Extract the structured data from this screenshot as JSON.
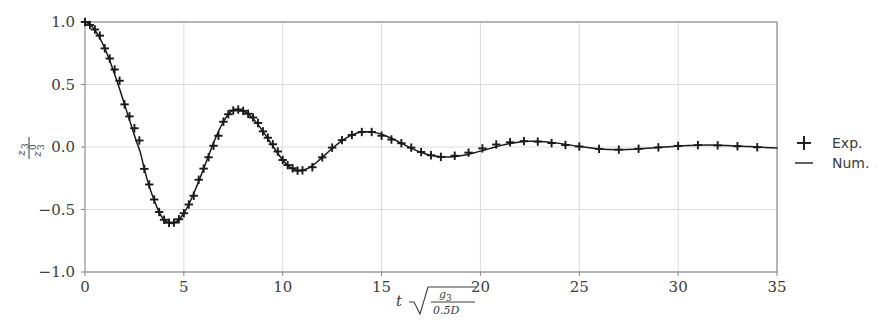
{
  "figure": {
    "background_color": "#ffffff",
    "axes_color": "#888888",
    "grid_color": "#d8d8d8",
    "data_color": "#1a1a1a",
    "text_color": "#3c3c3c"
  },
  "axes": {
    "x": {
      "label_plain": "t sqrt(g3 / (0.5 D))",
      "label_parts": {
        "variable": "t",
        "radical": "√",
        "numerator": "g",
        "numerator_sub": "3",
        "denominator": "0.5D"
      },
      "ticks": [
        "0",
        "5",
        "10",
        "15",
        "20",
        "25",
        "30",
        "35"
      ],
      "tick_values": [
        0,
        5,
        10,
        15,
        20,
        25,
        30,
        35
      ],
      "min": 0,
      "max": 35
    },
    "y": {
      "label_plain": "z3 / z3^0",
      "label_parts": {
        "numerator": "z",
        "numerator_sub": "3",
        "denominator": "z",
        "denominator_sub": "3",
        "denominator_sup": "0"
      },
      "ticks": [
        "1.0",
        "0.5",
        "0.0",
        "−0.5",
        "−1.0"
      ],
      "tick_values": [
        1.0,
        0.5,
        0.0,
        -0.5,
        -1.0
      ],
      "min": -1.0,
      "max": 1.0
    }
  },
  "legend": {
    "position": "right-outside",
    "entries": [
      {
        "label": "Exp.",
        "marker": "plus-marker",
        "style": "marker"
      },
      {
        "label": "Num.",
        "marker": "line-marker",
        "style": "line"
      }
    ]
  },
  "chart_data": {
    "type": "line",
    "title": "",
    "xlabel": "t √(g₃ / 0.5D)",
    "ylabel": "z₃ / z₃⁰",
    "xlim": [
      0,
      35
    ],
    "ylim": [
      -1.0,
      1.0
    ],
    "grid": true,
    "xticks": [
      0,
      5,
      10,
      15,
      20,
      25,
      30,
      35
    ],
    "yticks": [
      -1.0,
      -0.5,
      0.0,
      0.5,
      1.0
    ],
    "series": [
      {
        "name": "Num.",
        "style": "line",
        "x": [
          0.0,
          0.2,
          0.4,
          0.6,
          0.8,
          1.0,
          1.2,
          1.4,
          1.6,
          1.8,
          2.0,
          2.2,
          2.4,
          2.6,
          2.8,
          3.0,
          3.2,
          3.4,
          3.6,
          3.8,
          4.0,
          4.2,
          4.4,
          4.6,
          4.8,
          5.0,
          5.2,
          5.4,
          5.6,
          5.8,
          6.0,
          6.2,
          6.4,
          6.6,
          6.8,
          7.0,
          7.2,
          7.4,
          7.6,
          7.8,
          8.0,
          8.2,
          8.4,
          8.6,
          8.8,
          9.0,
          9.2,
          9.4,
          9.6,
          9.8,
          10.0,
          10.2,
          10.4,
          10.6,
          10.8,
          11.0,
          11.2,
          11.4,
          11.6,
          11.8,
          12.0,
          12.4,
          12.8,
          13.2,
          13.6,
          14.0,
          14.4,
          14.8,
          15.2,
          15.6,
          16.0,
          16.4,
          16.8,
          17.2,
          17.6,
          18.0,
          18.5,
          19.0,
          19.5,
          20.0,
          20.5,
          21.0,
          21.5,
          22.0,
          22.5,
          23.0,
          23.5,
          24.0,
          25.0,
          26.0,
          27.0,
          28.0,
          29.0,
          30.0,
          31.0,
          32.0,
          33.0,
          34.0,
          35.0
        ],
        "y": [
          1.0,
          0.985,
          0.955,
          0.912,
          0.856,
          0.789,
          0.712,
          0.627,
          0.536,
          0.44,
          0.341,
          0.241,
          0.142,
          0.046,
          -0.045,
          -0.175,
          -0.289,
          -0.383,
          -0.466,
          -0.537,
          -0.582,
          -0.604,
          -0.611,
          -0.6,
          -0.572,
          -0.53,
          -0.474,
          -0.408,
          -0.334,
          -0.255,
          -0.173,
          -0.09,
          -0.008,
          0.07,
          0.141,
          0.202,
          0.252,
          0.287,
          0.3,
          0.298,
          0.289,
          0.27,
          0.243,
          0.209,
          0.169,
          0.125,
          0.079,
          0.031,
          -0.016,
          -0.062,
          -0.104,
          -0.14,
          -0.167,
          -0.184,
          -0.19,
          -0.187,
          -0.176,
          -0.159,
          -0.137,
          -0.111,
          -0.083,
          -0.026,
          0.027,
          0.071,
          0.103,
          0.12,
          0.122,
          0.111,
          0.09,
          0.062,
          0.03,
          -0.002,
          -0.031,
          -0.054,
          -0.07,
          -0.078,
          -0.079,
          -0.07,
          -0.054,
          -0.033,
          -0.011,
          0.011,
          0.028,
          0.04,
          0.046,
          0.045,
          0.039,
          0.029,
          0.004,
          -0.015,
          -0.021,
          -0.016,
          -0.004,
          0.008,
          0.015,
          0.015,
          0.009,
          0.0,
          -0.008
        ]
      },
      {
        "name": "Exp.",
        "style": "markers",
        "marker": "+",
        "x": [
          0.0,
          0.25,
          0.5,
          0.75,
          1.0,
          1.25,
          1.5,
          1.75,
          2.0,
          2.25,
          2.5,
          2.75,
          3.0,
          3.25,
          3.5,
          3.75,
          4.0,
          4.25,
          4.5,
          4.75,
          5.0,
          5.25,
          5.5,
          5.75,
          6.0,
          6.25,
          6.5,
          6.75,
          7.0,
          7.25,
          7.5,
          7.75,
          8.0,
          8.25,
          8.5,
          8.75,
          9.0,
          9.25,
          9.5,
          9.75,
          10.0,
          10.25,
          10.5,
          10.75,
          11.0,
          11.5,
          12.0,
          12.5,
          13.0,
          13.5,
          14.0,
          14.5,
          15.0,
          15.5,
          16.0,
          16.5,
          17.0,
          17.5,
          18.0,
          18.7,
          19.4,
          20.1,
          20.8,
          21.5,
          22.2,
          22.9,
          23.6,
          24.3,
          25.0,
          26.0,
          27.0,
          28.0,
          29.0,
          30.0,
          31.0,
          32.0,
          33.0,
          34.0
        ],
        "y": [
          1.0,
          0.976,
          0.94,
          0.891,
          0.789,
          0.708,
          0.62,
          0.53,
          0.341,
          0.245,
          0.15,
          0.052,
          -0.175,
          -0.3,
          -0.42,
          -0.52,
          -0.582,
          -0.606,
          -0.605,
          -0.578,
          -0.53,
          -0.46,
          -0.39,
          -0.262,
          -0.173,
          -0.082,
          0.01,
          0.09,
          0.202,
          0.262,
          0.292,
          0.3,
          0.289,
          0.266,
          0.236,
          0.192,
          0.125,
          0.074,
          0.022,
          -0.036,
          -0.104,
          -0.145,
          -0.17,
          -0.189,
          -0.187,
          -0.162,
          -0.083,
          -0.005,
          0.055,
          0.096,
          0.12,
          0.12,
          0.09,
          0.06,
          0.03,
          -0.005,
          -0.04,
          -0.066,
          -0.079,
          -0.07,
          -0.045,
          -0.011,
          0.02,
          0.038,
          0.047,
          0.043,
          0.031,
          0.016,
          0.004,
          -0.015,
          -0.021,
          -0.014,
          -0.003,
          0.009,
          0.015,
          0.013,
          0.006,
          -0.002
        ]
      }
    ]
  }
}
